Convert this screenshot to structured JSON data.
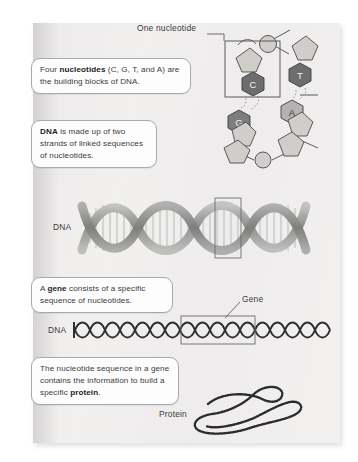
{
  "figure": {
    "background_color": "#efeeed",
    "page_color": "#eceaea"
  },
  "callouts": [
    {
      "id": "nucleotides",
      "parts": [
        {
          "text": "Four ",
          "bold": false
        },
        {
          "text": "nucleotides",
          "bold": true
        },
        {
          "text": " (C, G, T, and A) are the building blocks of DNA.",
          "bold": false
        }
      ]
    },
    {
      "id": "dna_strands",
      "parts": [
        {
          "text": "DNA",
          "bold": true
        },
        {
          "text": " is made up of two strands of linked sequences of nucleotides.",
          "bold": false
        }
      ]
    },
    {
      "id": "gene",
      "parts": [
        {
          "text": "A ",
          "bold": false
        },
        {
          "text": "gene",
          "bold": true
        },
        {
          "text": " consists of a specific sequence of nucleotides.",
          "bold": false
        }
      ]
    },
    {
      "id": "protein",
      "parts": [
        {
          "text": "The nucleotide sequence in a gene contains the information to build a specific ",
          "bold": false
        },
        {
          "text": "protein",
          "bold": true
        },
        {
          "text": ".",
          "bold": false
        }
      ]
    }
  ],
  "labels": {
    "one_nucleotide": "One nucleotide",
    "dna_helix": "DNA",
    "gene": "Gene",
    "dna_strand": "DNA",
    "protein": "Protein"
  },
  "nucleotide_diagram": {
    "left_strand_bases": [
      "C",
      "G"
    ],
    "right_strand_bases": [
      "T",
      "A"
    ],
    "base_colors": {
      "C": "#6d6d6d",
      "G": "#7d7d7d",
      "T": "#6d6d6d",
      "A": "#b4b3b1"
    },
    "sugar_color": "#c9c8c5",
    "phosphate_color": "#c9c8c5",
    "outline_color": "#4a4a4a",
    "highlight_box": "one nucleotide"
  },
  "helix": {
    "backbone_color": "#9a9a99",
    "rung_color": "#d8d8d6",
    "turns": 4,
    "highlight_box": "one segment"
  },
  "strand": {
    "line_color": "#3a3a3a",
    "zigzag_periods": 18,
    "highlight_box": "gene region"
  },
  "protein": {
    "bead_color": "#2e2e2e",
    "shape": "folded beaded chain"
  }
}
